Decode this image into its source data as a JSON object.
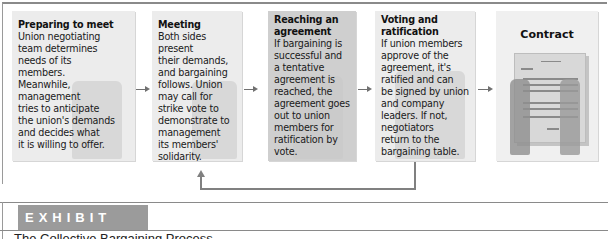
{
  "diagram": {
    "steps": [
      {
        "title": "Preparing to meet",
        "lines": [
          "Union negotiating",
          "team determines",
          "needs of its",
          "members.",
          "Meanwhile,",
          "management",
          "tries to anticipate",
          "the union's demands",
          "and decides what",
          "it is willing to offer."
        ]
      },
      {
        "title": "Meeting",
        "lines": [
          "Both sides present",
          "their demands,",
          "and bargaining",
          "follows. Union",
          "may call for",
          "strike vote to",
          "demonstrate to",
          "management",
          "its members'",
          "solidarity."
        ]
      },
      {
        "title_lines": [
          "Reaching an",
          "agreement"
        ],
        "lines": [
          "If bargaining is",
          "successful and",
          "a tentative",
          "agreement is",
          "reached, the",
          "agreement goes",
          "out to union",
          "members for",
          "ratification by",
          "vote."
        ]
      },
      {
        "title_lines": [
          "Voting and",
          "ratification"
        ],
        "lines": [
          "If union members",
          "approve of the",
          "agreement, it's",
          "ratified and can",
          "be signed by union",
          "and company",
          "leaders. If not,",
          "negotiators",
          "return to the",
          "bargaining table."
        ]
      },
      {
        "title": "Contract"
      }
    ],
    "loop_arrow": "from Voting and ratification back to Meeting",
    "colors": {
      "box_light": "#ececec",
      "box_dark": "#cfcfcf",
      "arrow": "#707070",
      "exhibit_bg": "#9b9b9b"
    }
  },
  "exhibit": {
    "label": "EXHIBIT 10.8",
    "caption": "The Collective Bargaining Process"
  }
}
